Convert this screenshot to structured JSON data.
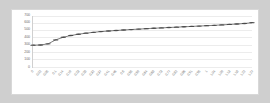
{
  "chart": {
    "title": "",
    "background_color": "#ffffff",
    "frame_color": "#cfcfcf",
    "series_color": "#4a4a4a",
    "gridline_color": "#ececec",
    "axis_color": "#d0d0d0"
  },
  "chart_data": {
    "type": "line",
    "title": "",
    "xlabel": "",
    "ylabel": "",
    "ylim": [
      0,
      700
    ],
    "yticks": [
      0,
      100,
      200,
      300,
      400,
      500,
      600,
      700
    ],
    "grid": true,
    "legend": "none",
    "marker": "circle",
    "categories": [
      "0",
      "0.02",
      "0.05",
      "0.1",
      "0.14",
      "0.19",
      "0.23",
      "0.28",
      "0.32",
      "0.37",
      "0.41",
      "0.46",
      "0.5",
      "0.55",
      "0.59",
      "0.64",
      "0.68",
      "0.73",
      "0.77",
      "0.82",
      "0.86",
      "0.91",
      "0.95",
      "1",
      "1.04",
      "1.09",
      "1.13",
      "1.18",
      "1.22",
      "1.27"
    ],
    "values": [
      300,
      302,
      318,
      372,
      408,
      432,
      450,
      464,
      476,
      486,
      494,
      501,
      508,
      514,
      520,
      526,
      532,
      537,
      542,
      547,
      552,
      557,
      562,
      567,
      572,
      578,
      584,
      590,
      597,
      608
    ]
  }
}
